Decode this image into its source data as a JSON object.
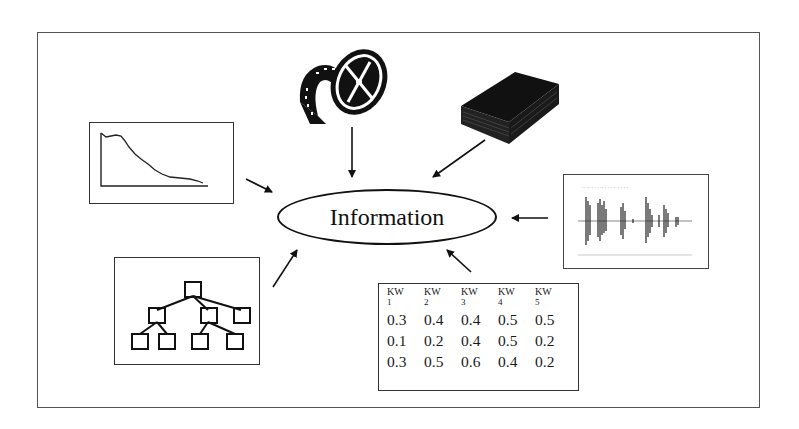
{
  "diagram": {
    "center_label": "Information",
    "sources": [
      {
        "id": "line-chart",
        "kind": "time-series plot"
      },
      {
        "id": "film-reel",
        "kind": "video / film"
      },
      {
        "id": "book",
        "kind": "text document"
      },
      {
        "id": "audio-waveform",
        "kind": "audio signal"
      },
      {
        "id": "tree-hierarchy",
        "kind": "hierarchical structure"
      },
      {
        "id": "keyword-table",
        "kind": "keyword vector table"
      }
    ],
    "keyword_table": {
      "headers": [
        {
          "top": "KW",
          "sub": "1"
        },
        {
          "top": "KW",
          "sub": "2"
        },
        {
          "top": "KW",
          "sub": "3"
        },
        {
          "top": "KW",
          "sub": "4"
        },
        {
          "top": "KW",
          "sub": "5"
        }
      ],
      "rows": [
        [
          "0.3",
          "0.4",
          "0.4",
          "0.5",
          "0.5"
        ],
        [
          "0.1",
          "0.2",
          "0.4",
          "0.5",
          "0.2"
        ],
        [
          "0.3",
          "0.5",
          "0.6",
          "0.4",
          "0.2"
        ]
      ]
    },
    "colors": {
      "stroke": "#111111",
      "frame": "#555555",
      "background": "#ffffff"
    }
  }
}
